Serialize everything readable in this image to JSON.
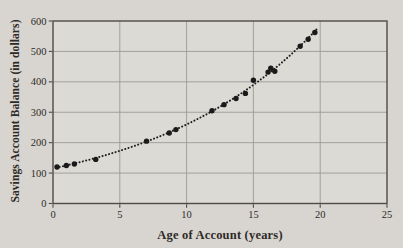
{
  "chart_data": {
    "type": "scatter",
    "title": "",
    "xlabel": "Age of Account (years)",
    "ylabel": "Savings Account Balance (in dollars)",
    "xlim": [
      0,
      25
    ],
    "ylim": [
      0,
      600
    ],
    "x_ticks": [
      0,
      5,
      10,
      15,
      20,
      25
    ],
    "y_ticks": [
      0,
      100,
      200,
      300,
      400,
      500,
      600
    ],
    "grid": true,
    "legend": "none",
    "points": [
      [
        0.3,
        120
      ],
      [
        1.0,
        125
      ],
      [
        1.6,
        130
      ],
      [
        3.2,
        145
      ],
      [
        7.0,
        205
      ],
      [
        8.7,
        232
      ],
      [
        9.2,
        243
      ],
      [
        11.9,
        305
      ],
      [
        12.8,
        325
      ],
      [
        13.7,
        345
      ],
      [
        14.4,
        362
      ],
      [
        15.0,
        405
      ],
      [
        16.1,
        432
      ],
      [
        16.3,
        445
      ],
      [
        16.6,
        435
      ],
      [
        18.5,
        517
      ],
      [
        19.1,
        540
      ],
      [
        19.6,
        562
      ]
    ],
    "trendline": {
      "style": "dotted",
      "model": "exponential",
      "a": 115.5,
      "b": 1.0845,
      "x_start": 0.25,
      "x_end": 19.85
    },
    "colors": {
      "page_bg": "#d8d5d0",
      "plot_bg": "#dcdad5",
      "grid": "#9b9a97",
      "frame": "#4e4b47",
      "text": "#2e2b27",
      "point": "#1a1a1a",
      "trend": "#1f1f1f"
    }
  }
}
